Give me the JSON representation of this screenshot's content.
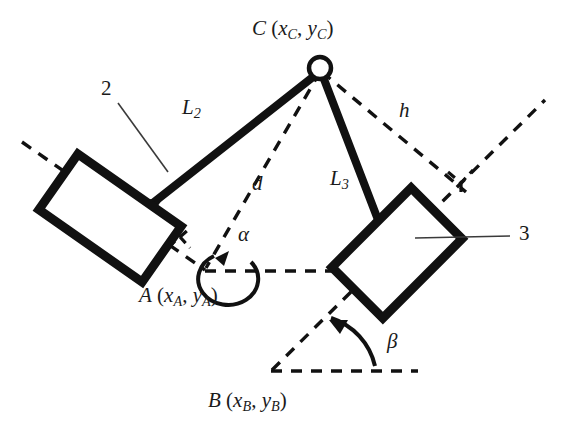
{
  "figure": {
    "background_color": "#ffffff",
    "line_color": "#111111",
    "width": 568,
    "height": 435
  },
  "points": [
    {
      "id": "C",
      "label": "C",
      "coord_text": "(x",
      "sub1": "C",
      "sep": ", y",
      "sub2": "C",
      "close": ")",
      "full_text": "C (xC, yC)",
      "x": 320,
      "y": 65,
      "joint": "revolute-pin"
    },
    {
      "id": "A",
      "label": "A",
      "coord_text": "(x",
      "sub1": "A",
      "sep": ", y",
      "sub2": "A",
      "close": ")",
      "full_text": "A (xA, yA)",
      "x": 203,
      "y": 270,
      "joint": "slider-reference"
    },
    {
      "id": "B",
      "label": "B",
      "coord_text": "(x",
      "sub1": "B",
      "sep": ", y",
      "sub2": "B",
      "close": ")",
      "full_text": "B (xB, yB)",
      "x": 272,
      "y": 370,
      "joint": "slider-reference"
    }
  ],
  "links": [
    {
      "id": "L2",
      "label": "L",
      "sub": "2",
      "from": "slider-2",
      "to": "C",
      "style": "thick-solid"
    },
    {
      "id": "L3",
      "label": "L",
      "sub": "3",
      "from": "C",
      "to": "slider-3",
      "style": "thick-solid"
    }
  ],
  "distances": [
    {
      "id": "d",
      "label": "d",
      "from": "C",
      "to": "A",
      "style": "dashed"
    },
    {
      "id": "h",
      "label": "h",
      "from": "C",
      "to": "axis-3",
      "style": "dashed"
    }
  ],
  "angles": [
    {
      "id": "alpha",
      "label": "α",
      "vertex": "A",
      "style": "arc-arrow",
      "direction": "counterclockwise"
    },
    {
      "id": "beta",
      "label": "β",
      "vertex": "B",
      "style": "arc-arrow",
      "direction": "counterclockwise"
    }
  ],
  "bodies": [
    {
      "id": "slider-2",
      "number": "2",
      "shape": "rotated-rectangle",
      "leader": true
    },
    {
      "id": "slider-3",
      "number": "3",
      "shape": "rotated-rectangle",
      "leader": true
    }
  ],
  "markers": [
    {
      "id": "right-angle-A",
      "type": "right-angle-square",
      "style": "dashed"
    },
    {
      "id": "right-angle-h",
      "type": "right-angle-square",
      "style": "dashed"
    }
  ],
  "labels": {
    "C_main": "C",
    "C_coord_open": "(x",
    "C_sub_a": "C",
    "C_comma": ", y",
    "C_sub_b": "C",
    "C_close": ")",
    "A_main": "A",
    "A_coord_open": "(x",
    "A_sub_a": "A",
    "A_comma": ", y",
    "A_sub_b": "A",
    "A_close": ")",
    "B_main": "B",
    "B_coord_open": "(x",
    "B_sub_a": "B",
    "B_comma": ", y",
    "B_sub_b": "B",
    "B_close": ")",
    "L2_main": "L",
    "L2_sub": "2",
    "L3_main": "L",
    "L3_sub": "3",
    "d": "d",
    "h": "h",
    "alpha": "α",
    "beta": "β",
    "body2": "2",
    "body3": "3"
  }
}
